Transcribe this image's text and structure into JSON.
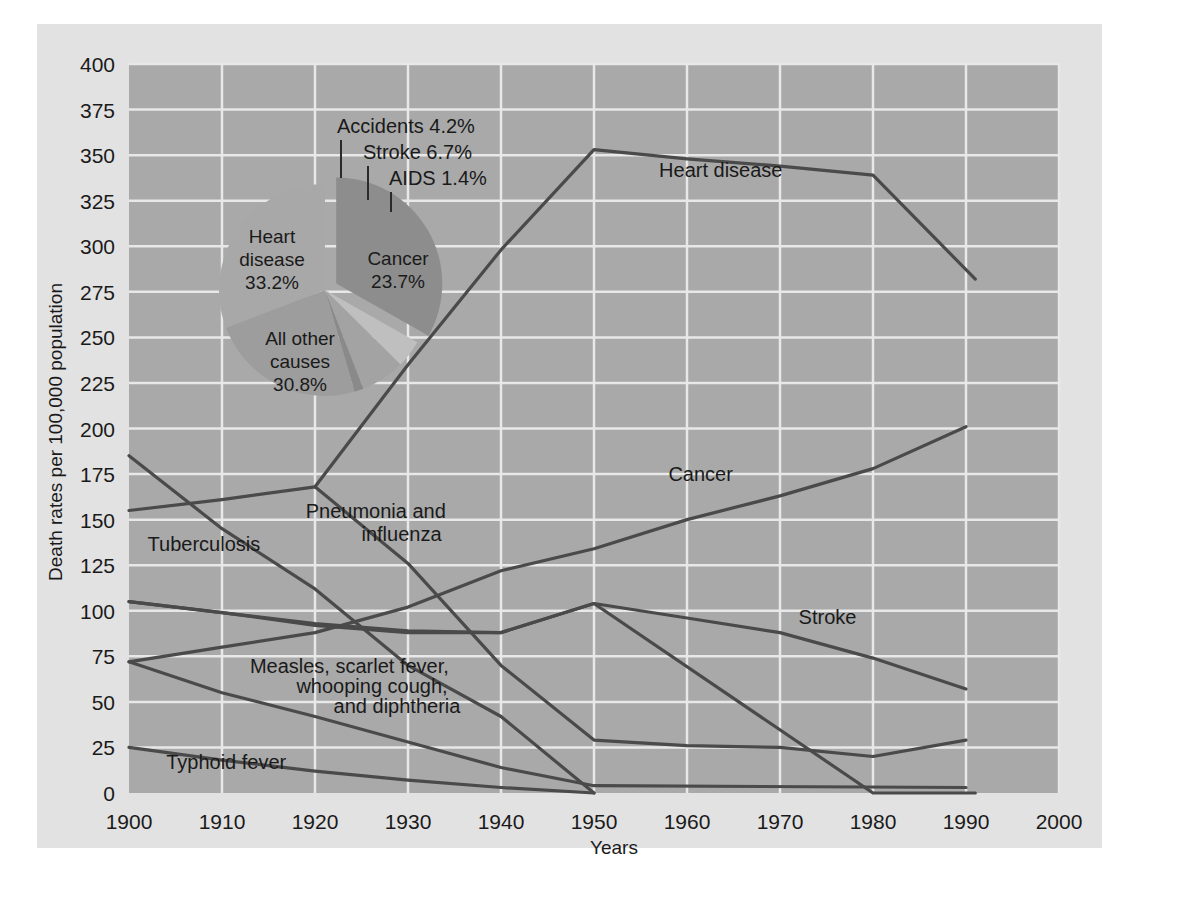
{
  "figure": {
    "background": "#ffffff",
    "panel_color": "#e2e2e2",
    "plot_color": "#a9a9a9",
    "grid_color": "#e8e8e8",
    "line_color": "#4a4a4a"
  },
  "chart_data": {
    "type": "line",
    "title": "",
    "xlabel": "Years",
    "ylabel": "Death rates per 100,000 population",
    "xlim": [
      1900,
      2000
    ],
    "ylim": [
      0,
      400
    ],
    "grid": true,
    "legend": "inline-labels",
    "xticks": [
      1900,
      1910,
      1920,
      1930,
      1940,
      1950,
      1960,
      1970,
      1980,
      1990,
      2000
    ],
    "yticks": [
      0,
      25,
      50,
      75,
      100,
      125,
      150,
      175,
      200,
      225,
      250,
      275,
      300,
      325,
      350,
      375,
      400
    ],
    "series": [
      {
        "name": "Heart disease",
        "label": "Heart disease",
        "label_pos": [
          1957,
          338
        ],
        "x": [
          1900,
          1910,
          1920,
          1930,
          1940,
          1950,
          1980,
          1991
        ],
        "values": [
          105,
          99,
          92,
          88,
          88,
          104,
          0,
          0
        ],
        "x2": [
          1900,
          1910,
          1920,
          1930,
          1940,
          1950,
          1960,
          1970,
          1980,
          1990
        ],
        "values2": [
          105,
          99,
          92,
          88,
          88,
          104,
          0,
          0,
          0,
          0
        ]
      },
      {
        "name": "Heart disease upper",
        "label": "",
        "x": [
          1920,
          1930,
          1940,
          1950,
          1960,
          1970,
          1980,
          1991
        ],
        "values": [
          168,
          235,
          298,
          353,
          348,
          344,
          339,
          282
        ]
      },
      {
        "name": "Cancer",
        "label": "Cancer",
        "label_pos": [
          1960,
          172
        ],
        "x": [
          1900,
          1910,
          1920,
          1930,
          1940,
          1950,
          1960,
          1970,
          1980,
          1990
        ],
        "values": [
          72,
          80,
          88,
          102,
          122,
          134,
          150,
          163,
          178,
          201
        ]
      },
      {
        "name": "Stroke",
        "label": "Stroke",
        "label_pos": [
          1971,
          93
        ],
        "x": [
          1900,
          1910,
          1920,
          1930,
          1940,
          1950,
          1960,
          1970,
          1980,
          1990
        ],
        "values": [
          105,
          99,
          93,
          89,
          88,
          104,
          96,
          88,
          74,
          57
        ]
      },
      {
        "name": "Tuberculosis",
        "label": "Tuberculosis",
        "label_pos": [
          1903,
          133
        ],
        "x": [
          1900,
          1910,
          1920,
          1930,
          1940,
          1950
        ],
        "values": [
          185,
          145,
          112,
          70,
          42,
          0
        ]
      },
      {
        "name": "Pneumonia and influenza",
        "label": "Pneumonia and influenza",
        "label_pos": [
          1925,
          148
        ],
        "x": [
          1900,
          1910,
          1920,
          1930,
          1940,
          1950,
          1960,
          1970,
          1980,
          1990
        ],
        "values": [
          155,
          161,
          168,
          126,
          70,
          29,
          26,
          25,
          20,
          29
        ]
      },
      {
        "name": "Measles, scarlet fever, whooping cough, and diphtheria",
        "label": "Measles, scarlet fever, whooping cough, and diphtheria",
        "label_pos": [
          1919,
          62
        ],
        "x": [
          1900,
          1910,
          1920,
          1930,
          1940,
          1950,
          1990
        ],
        "values": [
          72,
          55,
          42,
          28,
          14,
          4,
          3
        ]
      },
      {
        "name": "Typhoid fever",
        "label": "Typhoid fever",
        "label_pos": [
          1905,
          13
        ],
        "x": [
          1900,
          1910,
          1920,
          1930,
          1940,
          1950
        ],
        "values": [
          25,
          18,
          12,
          7,
          3,
          0
        ]
      }
    ],
    "series_labels": [
      {
        "text": "Heart disease",
        "x": 1957,
        "y": 338,
        "anchor": "start"
      },
      {
        "text": "Cancer",
        "x": 1958,
        "y": 171,
        "anchor": "start"
      },
      {
        "text": "Stroke",
        "x": 1972,
        "y": 93,
        "anchor": "start"
      },
      {
        "text": "Tuberculosis",
        "x": 1902,
        "y": 133,
        "anchor": "start"
      },
      {
        "text": "Pneumonia and",
        "x": 1919,
        "y": 151,
        "anchor": "start"
      },
      {
        "text": "influenza",
        "x": 1925,
        "y": 138,
        "anchor": "start"
      },
      {
        "text": "Measles, scarlet fever,",
        "x": 1913,
        "y": 66,
        "anchor": "start"
      },
      {
        "text": "whooping cough,",
        "x": 1918,
        "y": 55,
        "anchor": "start"
      },
      {
        "text": "and diphtheria",
        "x": 1922,
        "y": 44,
        "anchor": "start"
      },
      {
        "text": "Typhoid fever",
        "x": 1904,
        "y": 13,
        "anchor": "start"
      }
    ],
    "pie": {
      "type": "pie",
      "center_px": [
        325,
        290
      ],
      "radius_px": 106,
      "title": "",
      "slices": [
        {
          "label": "Heart disease",
          "value": 33.2,
          "pct_text": "33.2%",
          "color": "#8d8d8d",
          "exploded": true
        },
        {
          "label": "Accidents",
          "value": 4.2,
          "pct_text": "4.2%",
          "color": "#bfbfbf",
          "exploded": false
        },
        {
          "label": "Stroke",
          "value": 6.7,
          "pct_text": "6.7%",
          "color": "#a3a3a3",
          "exploded": false
        },
        {
          "label": "AIDS",
          "value": 1.4,
          "pct_text": "1.4%",
          "color": "#8a8a8a",
          "exploded": false
        },
        {
          "label": "Cancer",
          "value": 23.7,
          "pct_text": "23.7%",
          "color": "#9d9d9d",
          "exploded": false
        },
        {
          "label": "All other causes",
          "value": 30.8,
          "pct_text": "30.8%",
          "color": "#a8a8a8",
          "exploded": false
        }
      ],
      "inner_labels": [
        {
          "line1": "Heart",
          "line2": "disease",
          "line3": "33.2%",
          "px": [
            272,
            243
          ]
        },
        {
          "line1": "Cancer",
          "line2": "23.7%",
          "line3": "",
          "px": [
            398,
            265
          ]
        },
        {
          "line1": "All other",
          "line2": "causes",
          "line3": "30.8%",
          "px": [
            300,
            345
          ]
        }
      ],
      "callouts": [
        {
          "text": "Accidents 4.2%",
          "text_px": [
            337,
            133
          ],
          "leader": [
            341,
            140,
            341,
            178
          ]
        },
        {
          "text": "Stroke 6.7%",
          "text_px": [
            363,
            159
          ],
          "leader": [
            368,
            166,
            368,
            200
          ]
        },
        {
          "text": "AIDS 1.4%",
          "text_px": [
            389,
            185
          ],
          "leader": [
            391,
            192,
            391,
            212
          ]
        }
      ]
    }
  }
}
